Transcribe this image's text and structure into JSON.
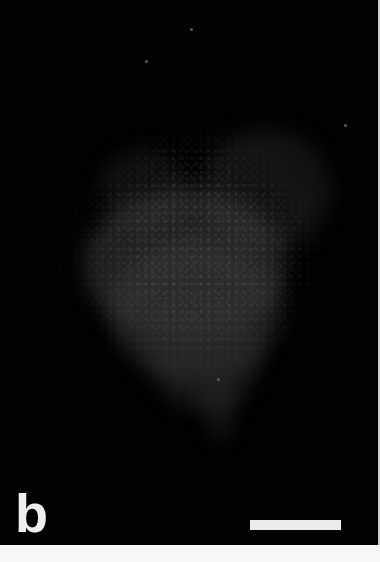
{
  "figure": {
    "panel_label": "b",
    "image_type": "fluorescence micrograph",
    "background_color": "#020202",
    "label_color": "#efefef",
    "scale_bar": {
      "color": "#ececec",
      "length_px": 91,
      "label": ""
    }
  }
}
